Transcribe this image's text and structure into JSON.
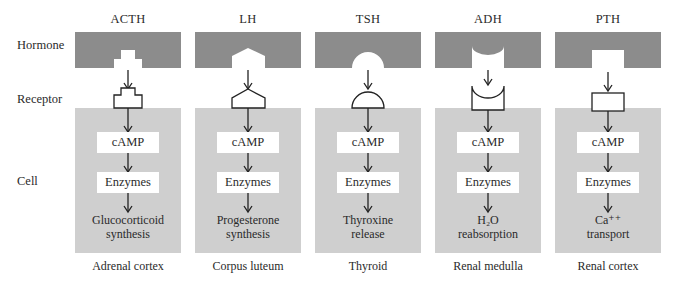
{
  "row_labels": {
    "hormone": "Hormone",
    "receptor": "Receptor",
    "cell": "Cell"
  },
  "colors": {
    "hormone_fill": "#8c8c8c",
    "cell_fill": "#cfcfcf",
    "box_fill": "#ffffff",
    "line": "#222222"
  },
  "columns": [
    {
      "hormone": "ACTH",
      "receptor_shape": "stepped-plus",
      "messenger": "cAMP",
      "enzymes": "Enzymes",
      "result_line1": "Glucocorticoid",
      "result_line2": "synthesis",
      "tissue": "Adrenal cortex"
    },
    {
      "hormone": "LH",
      "receptor_shape": "pentagon",
      "messenger": "cAMP",
      "enzymes": "Enzymes",
      "result_line1": "Progesterone",
      "result_line2": "synthesis",
      "tissue": "Corpus luteum"
    },
    {
      "hormone": "TSH",
      "receptor_shape": "semicircle",
      "messenger": "cAMP",
      "enzymes": "Enzymes",
      "result_line1": "Thyroxine",
      "result_line2": "release",
      "tissue": "Thyroid"
    },
    {
      "hormone": "ADH",
      "receptor_shape": "concave-cup",
      "messenger": "cAMP",
      "enzymes": "Enzymes",
      "result_line1": "H₂O",
      "result_line2": "reabsorption",
      "tissue": "Renal medulla"
    },
    {
      "hormone": "PTH",
      "receptor_shape": "rectangle",
      "messenger": "cAMP",
      "enzymes": "Enzymes",
      "result_line1": "Ca⁺⁺",
      "result_line2": "transport",
      "tissue": "Renal cortex"
    }
  ]
}
